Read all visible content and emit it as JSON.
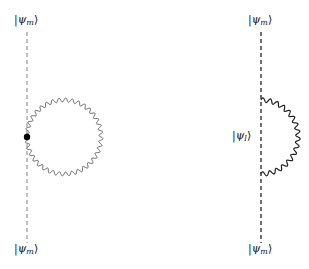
{
  "diagram": {
    "left": {
      "top_label": {
        "psi": "ψ",
        "sub": "m"
      },
      "bottom_label": {
        "psi": "ψ",
        "sub": "m"
      },
      "line_color": "#9a9a9a",
      "loop_color": "#555555",
      "vertex_color": "#000000",
      "line_x": 27,
      "loop_center": [
        64,
        137
      ],
      "loop_radius": 37
    },
    "right": {
      "top_label": {
        "psi": "ψ",
        "sub": "m"
      },
      "middle_label": {
        "psi": "ψ",
        "sub": "l"
      },
      "bottom_label": {
        "psi": "ψ",
        "sub": "m"
      },
      "line_color": "#222222",
      "arc_color": "#222222",
      "line_x": 261,
      "arc_center": [
        261,
        137
      ],
      "arc_radius": 37
    }
  }
}
